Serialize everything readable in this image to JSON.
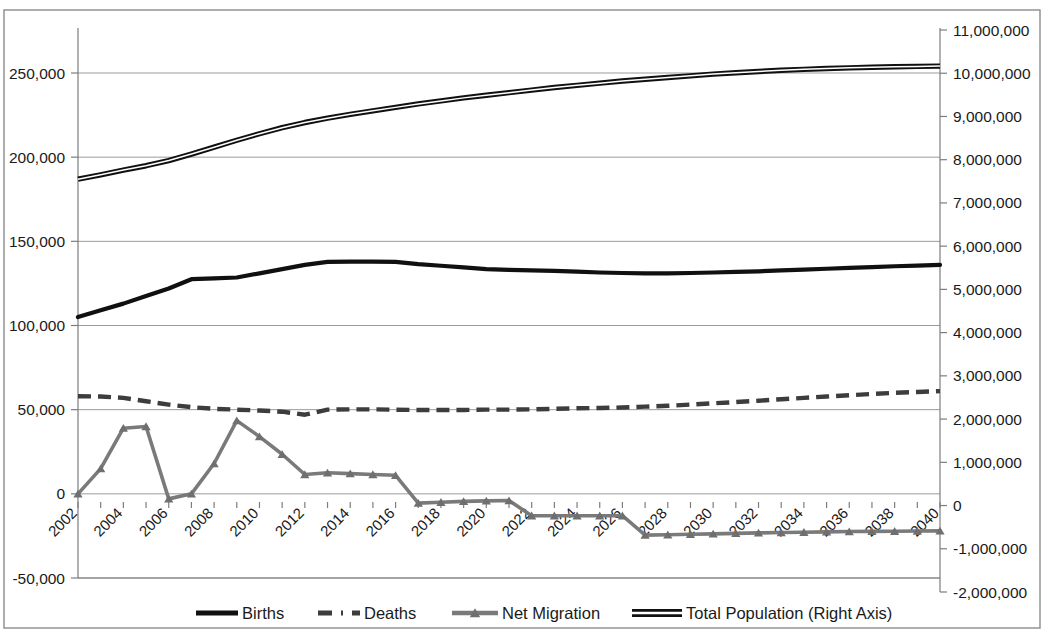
{
  "chart_data": {
    "type": "line",
    "title": "",
    "subtitle": "",
    "xlabel": "",
    "ylabel": "",
    "grid": true,
    "legend_position": "bottom",
    "x": [
      2002,
      2003,
      2004,
      2005,
      2006,
      2007,
      2008,
      2009,
      2010,
      2011,
      2012,
      2013,
      2014,
      2015,
      2016,
      2017,
      2018,
      2019,
      2020,
      2021,
      2022,
      2023,
      2024,
      2025,
      2026,
      2027,
      2028,
      2029,
      2030,
      2031,
      2032,
      2033,
      2034,
      2035,
      2036,
      2037,
      2038,
      2039,
      2040
    ],
    "x_tick_labels": [
      "2002",
      "2004",
      "2006",
      "2008",
      "2010",
      "2012",
      "2014",
      "2016",
      "2018",
      "2020",
      "2022",
      "2024",
      "2026",
      "2028",
      "2030",
      "2032",
      "2034",
      "2036",
      "2038",
      "2040"
    ],
    "left_axis": {
      "label": "",
      "ticks": [
        "-50,000",
        "0",
        "50,000",
        "100,000",
        "150,000",
        "200,000",
        "250,000"
      ],
      "tick_values": [
        -50000,
        0,
        50000,
        100000,
        150000,
        200000,
        250000
      ],
      "min": -50000,
      "max": 270000
    },
    "right_axis": {
      "label": "Right Axis",
      "ticks": [
        "-2,000,000",
        "-1,000,000",
        "0",
        "1,000,000",
        "2,000,000",
        "3,000,000",
        "4,000,000",
        "5,000,000",
        "6,000,000",
        "7,000,000",
        "8,000,000",
        "9,000,000",
        "10,000,000",
        "11,000,000"
      ],
      "tick_values": [
        -2000000,
        -1000000,
        0,
        1000000,
        2000000,
        3000000,
        4000000,
        5000000,
        6000000,
        7000000,
        8000000,
        9000000,
        10000000,
        11000000
      ],
      "min": -2000000,
      "max": 11000000
    },
    "series": [
      {
        "name": "Births",
        "axis": "left",
        "style": "solid-thick",
        "color": "#101010",
        "values": [
          105000,
          109000,
          113000,
          117500,
          122000,
          127500,
          128000,
          128500,
          131000,
          133500,
          136000,
          137800,
          138000,
          138000,
          137800,
          136500,
          135500,
          134500,
          133500,
          133000,
          132800,
          132500,
          132000,
          131500,
          131200,
          131000,
          131000,
          131200,
          131500,
          131800,
          132200,
          132700,
          133200,
          133700,
          134200,
          134700,
          135200,
          135600,
          136000
        ]
      },
      {
        "name": "Deaths",
        "axis": "left",
        "style": "dashed",
        "color": "#3d3d3d",
        "values": [
          58000,
          57800,
          57000,
          55000,
          53000,
          51500,
          50500,
          50000,
          49500,
          48800,
          47000,
          50000,
          50200,
          50200,
          50000,
          49800,
          49800,
          49800,
          50000,
          50000,
          50200,
          50500,
          50800,
          51000,
          51300,
          51800,
          52300,
          53000,
          53800,
          54500,
          55300,
          56200,
          57000,
          57800,
          58600,
          59300,
          60000,
          60500,
          61000
        ]
      },
      {
        "name": "Net Migration",
        "axis": "left",
        "style": "solid-marker",
        "color": "#7a7a7a",
        "values": [
          0,
          15000,
          39000,
          40000,
          -3000,
          0,
          18000,
          43500,
          34000,
          23500,
          11500,
          12500,
          12000,
          11500,
          11000,
          -5500,
          -5000,
          -4500,
          -4200,
          -4000,
          -13000,
          -13000,
          -13000,
          -13000,
          -13000,
          -24500,
          -24300,
          -24000,
          -23800,
          -23500,
          -23200,
          -23000,
          -22800,
          -22600,
          -22400,
          -22300,
          -22200,
          -22100,
          -22000
        ]
      },
      {
        "name": "Total Population",
        "axis": "right",
        "style": "double-line",
        "color": "#101010",
        "values": [
          7550000,
          7650000,
          7760000,
          7860000,
          7980000,
          8130000,
          8290000,
          8450000,
          8600000,
          8740000,
          8860000,
          8960000,
          9050000,
          9130000,
          9210000,
          9290000,
          9360000,
          9430000,
          9490000,
          9550000,
          9610000,
          9670000,
          9720000,
          9770000,
          9820000,
          9860000,
          9900000,
          9940000,
          9980000,
          10010000,
          10040000,
          10070000,
          10090000,
          10110000,
          10125000,
          10140000,
          10150000,
          10158000,
          10165000
        ]
      }
    ],
    "legend": [
      {
        "label": "Births",
        "style": "solid-thick",
        "color": "#101010"
      },
      {
        "label": "Deaths",
        "style": "dashed",
        "color": "#3d3d3d"
      },
      {
        "label": "Net Migration",
        "style": "solid-marker",
        "color": "#7a7a7a"
      },
      {
        "label": "Total Population  (Right Axis)",
        "style": "double-line",
        "color": "#101010"
      }
    ]
  }
}
